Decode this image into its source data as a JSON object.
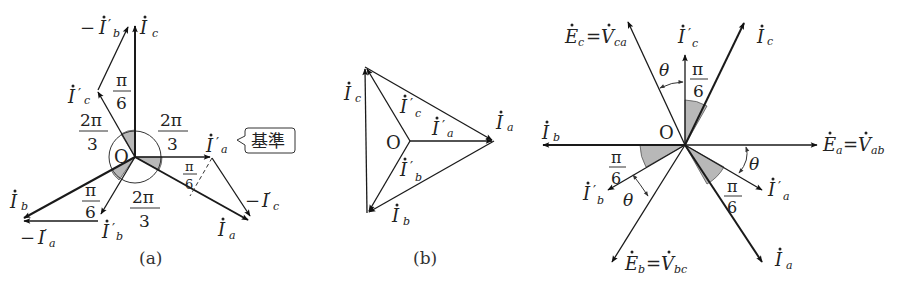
{
  "figure": {
    "panels": [
      {
        "id": "a",
        "caption": "(a)",
        "origin_label": "O",
        "labels": {
          "Ic": "İc",
          "Ia": "İa",
          "Ib": "İb",
          "Ia_prime": "İ′a",
          "Ib_prime": "İ′b",
          "Ic_prime": "İ′c",
          "neg_Ia_prime": "−İ′a",
          "neg_Ib_prime": "−İ′b",
          "neg_Ic_prime": "−İ′c"
        },
        "angles": {
          "two_pi_3_num": "2π",
          "two_pi_3_den": "3",
          "pi_6_num": "π",
          "pi_6_den": "6"
        },
        "reference_callout": "基準"
      },
      {
        "id": "b",
        "caption": "(b)",
        "origin_label": "O",
        "labels": {
          "Ia": "İa",
          "Ib": "İb",
          "Ic": "İc",
          "Ia_prime": "İ′a",
          "Ib_prime": "İ′b",
          "Ic_prime": "İ′c"
        }
      },
      {
        "id": "c",
        "caption": "",
        "origin_label": "O",
        "labels": {
          "Ea": "Ėa = V̇ab",
          "Eb": "Ėb = V̇bc",
          "Ec": "Ėc = V̇ca",
          "Ia": "İa",
          "Ib": "İb",
          "Ic": "İc",
          "Ia_prime": "İ′a",
          "Ib_prime": "İ′b",
          "Ic_prime": "İ′c"
        },
        "angles": {
          "theta": "θ",
          "pi_6_num": "π",
          "pi_6_den": "6"
        }
      }
    ]
  },
  "text": {
    "O": "O",
    "I": "I",
    "E": "E",
    "V": "V",
    "eq": "=",
    "minus": "−",
    "prime": "′",
    "sub_a": "a",
    "sub_b": "b",
    "sub_c": "c",
    "sub_ab": "ab",
    "sub_bc": "bc",
    "sub_ca": "ca",
    "two_pi": "2π",
    "three": "3",
    "pi": "π",
    "six": "6",
    "theta": "θ",
    "kijun": "基準",
    "cap_a": "(a)",
    "cap_b": "(b)"
  }
}
